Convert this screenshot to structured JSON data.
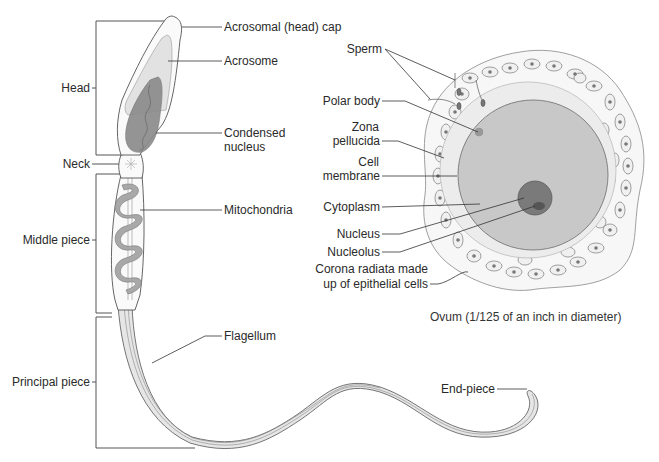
{
  "sperm": {
    "regions": {
      "head": "Head",
      "neck": "Neck",
      "middle_piece": "Middle piece",
      "principal_piece": "Principal piece"
    },
    "parts": {
      "acrosomal_cap": "Acrosomal (head) cap",
      "acrosome": "Acrosome",
      "condensed_nucleus_line1": "Condensed",
      "condensed_nucleus_line2": "nucleus",
      "mitochondria": "Mitochondria",
      "flagellum": "Flagellum",
      "end_piece": "End-piece"
    }
  },
  "ovum": {
    "labels": {
      "sperm": "Sperm",
      "polar_body": "Polar body",
      "zona_pellucida_line1": "Zona",
      "zona_pellucida_line2": "pellucida",
      "cell_membrane_line1": "Cell",
      "cell_membrane_line2": "membrane",
      "cytoplasm": "Cytoplasm",
      "nucleus": "Nucleus",
      "nucleolus": "Nucleolus",
      "corona_line1": "Corona radiata made",
      "corona_line2": "up of epithelial cells"
    },
    "caption": "Ovum (1/125 of an inch in diameter)"
  },
  "colors": {
    "outline": "#555555",
    "acrosome_fill": "#e2e2e2",
    "nucleus_fill": "#8a8a8a",
    "mitochondria_fill": "#a8a8a8",
    "flagellum_fill": "#e6e6e6",
    "zona_fill": "#ececec",
    "cytoplasm_fill": "#c8c8c8",
    "ovum_nucleus_fill": "#7a7a7a",
    "corona_cell_fill": "#f0f0f0"
  }
}
